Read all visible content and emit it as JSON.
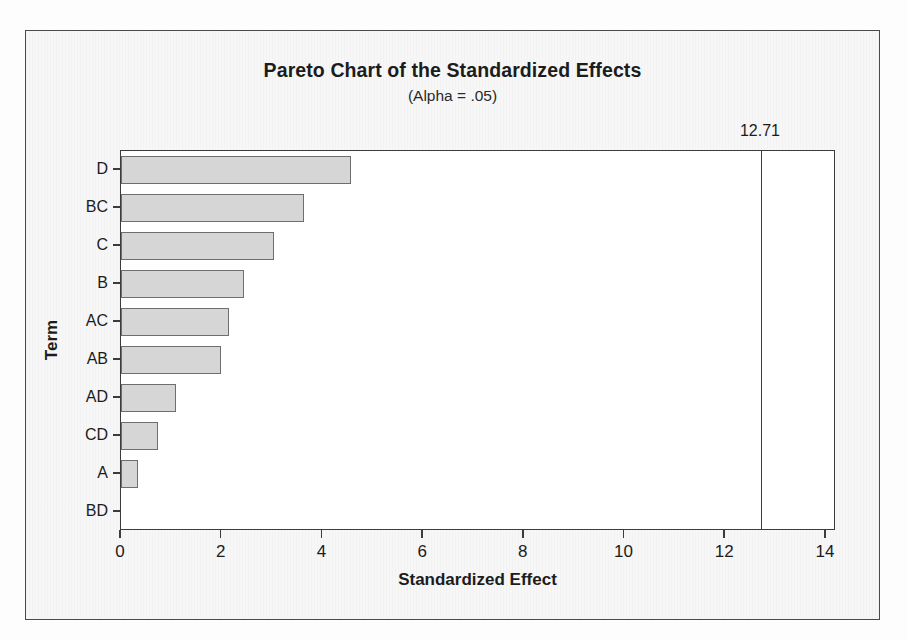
{
  "chart_data": {
    "type": "bar",
    "orientation": "horizontal",
    "title": "Pareto Chart of the Standardized Effects",
    "subtitle": "(Alpha = .05)",
    "xlabel": "Standardized Effect",
    "ylabel": "Term",
    "categories": [
      "D",
      "BC",
      "C",
      "B",
      "AC",
      "AB",
      "AD",
      "CD",
      "A",
      "BD"
    ],
    "values": [
      4.56,
      3.63,
      3.04,
      2.44,
      2.15,
      1.98,
      1.09,
      0.73,
      0.34,
      0.0
    ],
    "xlim": [
      0,
      14.2
    ],
    "xticks": [
      0,
      2,
      4,
      6,
      8,
      10,
      12,
      14
    ],
    "xtick_labels": [
      "0",
      "2",
      "4",
      "6",
      "8",
      "10",
      "12",
      "14"
    ],
    "grid": false,
    "legend": null,
    "reference_line": {
      "value": 12.71,
      "label": "12.71",
      "orientation": "vertical"
    },
    "colors": {
      "bar_fill": "#d6d6d6",
      "bar_border": "#6e6e6e",
      "axis": "#3c3c3c",
      "text": "#1c1c1c",
      "frame": "#4a4a4a",
      "plot_background": "#ffffff",
      "figure_background": "#f7f7f7"
    }
  }
}
